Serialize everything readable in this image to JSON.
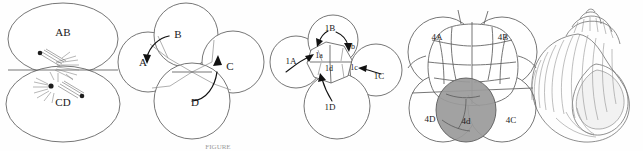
{
  "figure": {
    "caption": "FIGURE",
    "background_color": "#fefefe",
    "line_color": "#5d5d5d",
    "label_color": "#1a1a1a",
    "shaded_cell_color": "#9a9a9a",
    "panel_count": 5
  },
  "panels": [
    {
      "id": "panel-1",
      "name": "two-cell-stage",
      "description": "Two-cell embryo with mitotic spindle and asters at the cleavage plane",
      "labels": [
        {
          "text": "AB",
          "x": 63,
          "y": 33
        },
        {
          "text": "CD",
          "x": 63,
          "y": 103
        }
      ]
    },
    {
      "id": "panel-2",
      "name": "four-cell-stage",
      "description": "Four-cell embryo (quartet) with curved arrows indicating blastomere identity",
      "labels": [
        {
          "text": "A",
          "x": 143,
          "y": 63
        },
        {
          "text": "B",
          "x": 178,
          "y": 35
        },
        {
          "text": "C",
          "x": 230,
          "y": 67
        },
        {
          "text": "D",
          "x": 195,
          "y": 103
        }
      ]
    },
    {
      "id": "panel-3",
      "name": "first-micromere-quartet",
      "description": "Embryo after formation of the first quartet of micromeres (1a-1d) from macromeres 1A-1D",
      "labels": [
        {
          "text": "1B",
          "x": 330,
          "y": 29
        },
        {
          "text": "1A",
          "x": 291,
          "y": 62
        },
        {
          "text": "1a",
          "x": 319,
          "y": 56
        },
        {
          "text": "1b",
          "x": 351,
          "y": 47
        },
        {
          "text": "1d",
          "x": 329,
          "y": 69
        },
        {
          "text": "1c",
          "x": 354,
          "y": 68
        },
        {
          "text": "1C",
          "x": 379,
          "y": 77
        },
        {
          "text": "1D",
          "x": 330,
          "y": 108
        }
      ]
    },
    {
      "id": "panel-4",
      "name": "mesentoblast-stage",
      "description": "Later cleavage embryo with the shaded mesentoblast cell 4d among macromeres 4A-4D",
      "labels": [
        {
          "text": "4A",
          "x": 437,
          "y": 38
        },
        {
          "text": "4B",
          "x": 503,
          "y": 38
        },
        {
          "text": "4D",
          "x": 430,
          "y": 120
        },
        {
          "text": "4d",
          "x": 466,
          "y": 122
        },
        {
          "text": "4C",
          "x": 511,
          "y": 121
        }
      ]
    },
    {
      "id": "panel-5",
      "name": "adult-gastropod-shell",
      "description": "Adult coiled gastropod shell with apertural view",
      "labels": []
    }
  ]
}
